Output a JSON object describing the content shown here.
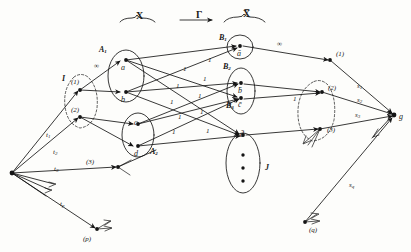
{
  "diagram": {
    "top_labels": [
      {
        "id": "brace-x",
        "text": "X",
        "x": 136,
        "y": 10
      },
      {
        "id": "gamma",
        "text": "Γ",
        "x": 196,
        "y": 9
      },
      {
        "id": "brace-xbar",
        "text": "X̅",
        "x": 243,
        "y": 8
      }
    ],
    "group_labels": [
      {
        "id": "I",
        "text": "I",
        "x": 62,
        "y": 74
      },
      {
        "id": "A1",
        "text": "A",
        "sub": "1",
        "x": 99,
        "y": 45
      },
      {
        "id": "A2",
        "text": "A",
        "sub": "2",
        "x": 150,
        "y": 147
      },
      {
        "id": "B1",
        "text": "B",
        "sub": "1",
        "x": 219,
        "y": 33
      },
      {
        "id": "B2",
        "text": "B",
        "sub": "2",
        "x": 223,
        "y": 62
      },
      {
        "id": "B3",
        "text": "B",
        "sub": "3",
        "x": 226,
        "y": 101
      },
      {
        "id": "J",
        "text": "J",
        "x": 265,
        "y": 163
      }
    ],
    "nodes": [
      {
        "id": "source",
        "label": "",
        "x": 12,
        "y": 173
      },
      {
        "id": "i1",
        "label": "(1)",
        "x": 80,
        "y": 90,
        "lx": 71,
        "ly": 78
      },
      {
        "id": "i2",
        "label": "(2)",
        "x": 80,
        "y": 117,
        "lx": 71,
        "ly": 106
      },
      {
        "id": "i3",
        "label": "(3)",
        "x": 118,
        "y": 167,
        "lx": 86,
        "ly": 158
      },
      {
        "id": "ip",
        "label": "(p)",
        "x": 97,
        "y": 229,
        "lx": 83,
        "ly": 235
      },
      {
        "id": "a",
        "label": "a",
        "x": 124,
        "y": 60,
        "lx": 121,
        "ly": 63
      },
      {
        "id": "b",
        "label": "b",
        "x": 124,
        "y": 92,
        "lx": 121,
        "ly": 95
      },
      {
        "id": "c",
        "label": "c",
        "x": 137,
        "y": 124,
        "lx": 134,
        "ly": 118
      },
      {
        "id": "d",
        "label": "d",
        "x": 137,
        "y": 146,
        "lx": 134,
        "ly": 149
      },
      {
        "id": "abar",
        "label": "ā",
        "x": 240,
        "y": 46,
        "lx": 237,
        "ly": 49
      },
      {
        "id": "bbar",
        "label": "b̄",
        "x": 241,
        "y": 83,
        "lx": 238,
        "ly": 86
      },
      {
        "id": "cbar",
        "label": "c̄",
        "x": 241,
        "y": 98,
        "lx": 238,
        "ly": 100
      },
      {
        "id": "dbar",
        "label": "d̄",
        "x": 243,
        "y": 135,
        "lx": 240,
        "ly": 130
      },
      {
        "id": "j1",
        "label": "(1)",
        "x": 330,
        "y": 60,
        "lx": 336,
        "ly": 50
      },
      {
        "id": "j2",
        "label": "(2)",
        "x": 322,
        "y": 92,
        "lx": 328,
        "ly": 84
      },
      {
        "id": "j3",
        "label": "(3)",
        "x": 320,
        "y": 129,
        "lx": 327,
        "ly": 126
      },
      {
        "id": "jq",
        "label": "(q)",
        "x": 305,
        "y": 222,
        "lx": 309,
        "ly": 226
      },
      {
        "id": "sink",
        "label": "g",
        "x": 394,
        "y": 115,
        "lx": 399,
        "ly": 112
      }
    ],
    "edge_labels": [
      {
        "id": "cap-inf-left",
        "text": "∞",
        "x": 94,
        "y": 62
      },
      {
        "id": "cap-inf-right",
        "text": "∞",
        "x": 277,
        "y": 40
      },
      {
        "id": "t1",
        "text": "t",
        "sub": "1",
        "x": 46,
        "y": 131
      },
      {
        "id": "t2",
        "text": "t",
        "sub": "2",
        "x": 53,
        "y": 148
      },
      {
        "id": "t3",
        "text": "t",
        "sub": "3",
        "x": 54,
        "y": 165
      },
      {
        "id": "tp",
        "text": "t",
        "sub": "p",
        "x": 60,
        "y": 200
      },
      {
        "id": "s1",
        "text": "s",
        "sub": "1",
        "x": 357,
        "y": 82
      },
      {
        "id": "s2",
        "text": "s",
        "sub": "2",
        "x": 357,
        "y": 96
      },
      {
        "id": "s3",
        "text": "s",
        "sub": "3",
        "x": 355,
        "y": 111
      },
      {
        "id": "sq",
        "text": "s",
        "sub": "q",
        "x": 349,
        "y": 181
      },
      {
        "id": "u1",
        "text": "1",
        "x": 183,
        "y": 65
      },
      {
        "id": "u2",
        "text": "1",
        "x": 208,
        "y": 56
      },
      {
        "id": "u3",
        "text": "1",
        "x": 176,
        "y": 82
      },
      {
        "id": "u4",
        "text": "1",
        "x": 203,
        "y": 75
      },
      {
        "id": "u5",
        "text": "1",
        "x": 170,
        "y": 98
      },
      {
        "id": "u6",
        "text": "1",
        "x": 198,
        "y": 92
      },
      {
        "id": "u7",
        "text": "1",
        "x": 178,
        "y": 113
      },
      {
        "id": "u8",
        "text": "1",
        "x": 200,
        "y": 108
      },
      {
        "id": "u9",
        "text": "1",
        "x": 172,
        "y": 128
      },
      {
        "id": "u10",
        "text": "1",
        "x": 206,
        "y": 127
      },
      {
        "id": "u11",
        "text": "1",
        "x": 293,
        "y": 95
      }
    ]
  }
}
